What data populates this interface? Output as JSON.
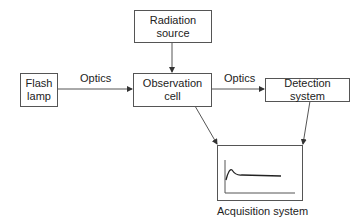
{
  "diagram": {
    "nodes": {
      "radiation_source": {
        "line1": "Radiation",
        "line2": "source"
      },
      "flash_lamp": {
        "line1": "Flash",
        "line2": "lamp"
      },
      "observation_cell": {
        "line1": "Observation",
        "line2": "cell"
      },
      "detection_system": {
        "label": "Detection system"
      },
      "acquisition_system": {
        "label": "Acquisition system"
      }
    },
    "edge_labels": {
      "lamp_to_cell": "Optics",
      "cell_to_detection": "Optics"
    },
    "colors": {
      "stroke": "#555555",
      "text": "#222222"
    }
  }
}
